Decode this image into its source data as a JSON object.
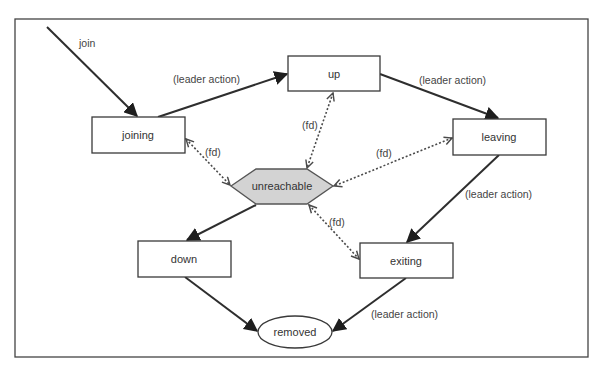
{
  "diagram": {
    "frame": {
      "x": 15,
      "y": 19,
      "width": 573,
      "height": 338
    },
    "colors": {
      "stroke": "#2e2e2e",
      "unreachable_fill": "#d3d3d3",
      "box_fill": "#ffffff",
      "text": "#333333"
    },
    "nodes": {
      "joining": {
        "label": "joining",
        "shape": "rectangle"
      },
      "up": {
        "label": "up",
        "shape": "rectangle"
      },
      "leaving": {
        "label": "leaving",
        "shape": "rectangle"
      },
      "unreachable": {
        "label": "unreachable",
        "shape": "hexagon"
      },
      "down": {
        "label": "down",
        "shape": "rectangle"
      },
      "exiting": {
        "label": "exiting",
        "shape": "rectangle"
      },
      "removed": {
        "label": "removed",
        "shape": "ellipse"
      }
    },
    "edges": [
      {
        "from": "start",
        "to": "joining",
        "label": "join",
        "style": "solid"
      },
      {
        "from": "joining",
        "to": "up",
        "label": "(leader action)",
        "style": "solid"
      },
      {
        "from": "up",
        "to": "leaving",
        "label": "(leader action)",
        "style": "solid"
      },
      {
        "from": "leaving",
        "to": "exiting",
        "label": "(leader action)",
        "style": "solid"
      },
      {
        "from": "exiting",
        "to": "removed",
        "label": "(leader action)",
        "style": "solid"
      },
      {
        "from": "unreachable",
        "to": "down",
        "label": "",
        "style": "solid"
      },
      {
        "from": "down",
        "to": "removed",
        "label": "",
        "style": "solid"
      },
      {
        "from": "joining",
        "to": "unreachable",
        "label": "(fd)",
        "style": "dotted-bidirectional"
      },
      {
        "from": "up",
        "to": "unreachable",
        "label": "(fd)",
        "style": "dotted-bidirectional"
      },
      {
        "from": "leaving",
        "to": "unreachable",
        "label": "(fd)",
        "style": "dotted-bidirectional"
      },
      {
        "from": "exiting",
        "to": "unreachable",
        "label": "(fd)",
        "style": "dotted-bidirectional"
      }
    ],
    "labels": {
      "join": "join",
      "joining_to_up": "(leader action)",
      "up_to_leaving": "(leader action)",
      "leaving_to_exiting": "(leader action)",
      "exiting_to_removed": "(leader action)",
      "fd_joining": "(fd)",
      "fd_up": "(fd)",
      "fd_leaving": "(fd)",
      "fd_exiting": "(fd)"
    }
  }
}
